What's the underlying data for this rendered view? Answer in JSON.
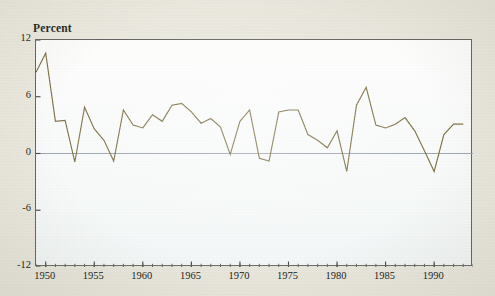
{
  "figure": {
    "axis_title": "Percent",
    "line_color": "#7a6d40",
    "zero_line_color": "#9aa3ad",
    "frame_color": "#5e5f5c",
    "plot_background": "#fbfcfb",
    "page_background": "#e9e7dd"
  },
  "chart_data": {
    "type": "line",
    "title": "",
    "subtitle": "",
    "xlabel": "",
    "ylabel": "Percent",
    "ylim": [
      -12,
      12
    ],
    "xlim": [
      1949,
      1994
    ],
    "grid": false,
    "legend": null,
    "y_ticks": [
      12,
      6,
      0,
      -6,
      -12
    ],
    "y_tick_labels": [
      "12",
      "6",
      "0",
      "-6",
      "-12"
    ],
    "x_ticks": [
      1950,
      1955,
      1960,
      1965,
      1970,
      1975,
      1980,
      1985,
      1990
    ],
    "x_tick_labels": [
      "1950",
      "1955",
      "1960",
      "1965",
      "1970",
      "1975",
      "1980",
      "1985",
      "1990"
    ],
    "x_minor_tick_interval": 1,
    "zero_reference_line": 0,
    "series": [
      {
        "name": "Percent",
        "x": [
          1949,
          1950,
          1951,
          1952,
          1953,
          1954,
          1955,
          1956,
          1957,
          1958,
          1959,
          1960,
          1961,
          1962,
          1963,
          1964,
          1965,
          1966,
          1967,
          1968,
          1969,
          1970,
          1971,
          1972,
          1973,
          1974,
          1975,
          1976,
          1977,
          1978,
          1979,
          1980,
          1981,
          1982,
          1983,
          1984,
          1985,
          1986,
          1987,
          1988,
          1989,
          1990,
          1991,
          1992,
          1993
        ],
        "values": [
          8.6,
          10.6,
          3.4,
          3.5,
          -0.9,
          4.9,
          2.6,
          1.4,
          -0.8,
          4.6,
          3.0,
          2.7,
          4.1,
          3.4,
          5.1,
          5.3,
          4.4,
          3.2,
          3.7,
          2.8,
          -0.1,
          3.4,
          4.6,
          -0.5,
          -0.8,
          4.4,
          4.6,
          4.6,
          2.0,
          1.4,
          0.6,
          2.4,
          -1.9,
          5.1,
          7.0,
          3.0,
          2.7,
          3.1,
          3.8,
          2.4,
          0.3,
          -1.9,
          2.0,
          3.1,
          3.1
        ]
      }
    ]
  },
  "y_axis_positions": {
    "top_value": 12,
    "bottom_value": -12
  },
  "x_axis_positions": {
    "left_value": 1949,
    "right_value": 1994
  }
}
